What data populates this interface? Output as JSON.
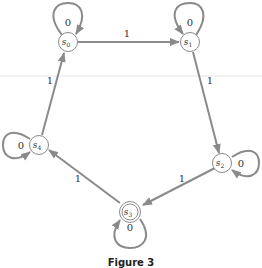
{
  "figure": {
    "caption": "Figure 3",
    "colors": {
      "edge": "#8a8a8a",
      "text": "#333333",
      "background": "#ffffff",
      "divider": "#e6e6e6"
    }
  },
  "states": [
    {
      "id": "s0",
      "name": "s",
      "sub": "0",
      "x": 68,
      "y": 42,
      "accepting": false,
      "loop_label": "0"
    },
    {
      "id": "s1",
      "name": "s",
      "sub": "1",
      "x": 190,
      "y": 42,
      "accepting": false,
      "loop_label": "0"
    },
    {
      "id": "s2",
      "name": "s",
      "sub": "2",
      "x": 224,
      "y": 163,
      "accepting": false,
      "loop_label": "0"
    },
    {
      "id": "s3",
      "name": "s",
      "sub": "3",
      "x": 130,
      "y": 212,
      "accepting": true,
      "loop_label": "0"
    },
    {
      "id": "s4",
      "name": "s",
      "sub": "4",
      "x": 38,
      "y": 145,
      "accepting": false,
      "loop_label": "0"
    }
  ],
  "transitions": [
    {
      "from": "s0",
      "to": "s1",
      "label": "1"
    },
    {
      "from": "s1",
      "to": "s2",
      "label": "1"
    },
    {
      "from": "s2",
      "to": "s3",
      "label": "1"
    },
    {
      "from": "s3",
      "to": "s4",
      "label": "1"
    },
    {
      "from": "s4",
      "to": "s0",
      "label": "1"
    }
  ],
  "labels": {
    "loop_s0": "0",
    "loop_s1": "0",
    "loop_s2": "0",
    "loop_s3": "0",
    "loop_s4": "0",
    "edge_s0_s1": "1",
    "edge_s1_s2": "1",
    "edge_s2_s3": "1",
    "edge_s3_s4": "1",
    "edge_s4_s0": "1",
    "s_letter": "s",
    "sub0": "0",
    "sub1": "1",
    "sub2": "2",
    "sub3": "3",
    "sub4": "4"
  }
}
